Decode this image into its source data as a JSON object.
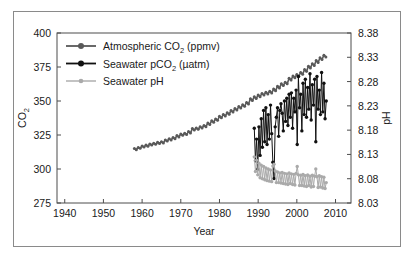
{
  "chart_data": {
    "type": "line",
    "title": "",
    "xlabel": "Year",
    "ylabel": "CO2",
    "ylabel_sub": "2",
    "y2label": "pH",
    "xlim": [
      1938,
      2014
    ],
    "ylim": [
      275,
      400
    ],
    "y2lim": [
      8.03,
      8.38
    ],
    "xticks": [
      1940,
      1950,
      1960,
      1970,
      1980,
      1990,
      2000,
      2010
    ],
    "yticks": [
      275,
      300,
      325,
      350,
      375,
      400
    ],
    "y2ticks": [
      "8.03",
      "8.08",
      "8.13",
      "8.18",
      "8.23",
      "8.28",
      "8.33",
      "8.38"
    ],
    "grid": false,
    "legend_position": "upper-left",
    "colors": {
      "atmospheric_co2": "#595959",
      "seawater_pco2": "#111111",
      "seawater_ph": "#aaaaaa",
      "frame": "#4d4d4d",
      "text": "#1a1a1a",
      "outer_border": "#8a8a8a",
      "background": "#ffffff"
    },
    "series": [
      {
        "name": "Atmospheric CO2 (ppmv)",
        "label_main": "Atmospheric CO",
        "label_sub": "2",
        "label_unit": " (ppmv)",
        "axis": "left",
        "color": "#595959",
        "x": [
          1958.0,
          1958.5,
          1959.0,
          1959.5,
          1960.0,
          1960.5,
          1961.0,
          1961.5,
          1962.0,
          1962.5,
          1963.0,
          1963.5,
          1964.0,
          1964.5,
          1965.0,
          1965.5,
          1966.0,
          1966.5,
          1967.0,
          1967.5,
          1968.0,
          1968.5,
          1969.0,
          1969.5,
          1970.0,
          1970.5,
          1971.0,
          1971.5,
          1972.0,
          1972.5,
          1973.0,
          1973.5,
          1974.0,
          1974.5,
          1975.0,
          1975.5,
          1976.0,
          1976.5,
          1977.0,
          1977.5,
          1978.0,
          1978.5,
          1979.0,
          1979.5,
          1980.0,
          1980.5,
          1981.0,
          1981.5,
          1982.0,
          1982.5,
          1983.0,
          1983.5,
          1984.0,
          1984.5,
          1985.0,
          1985.5,
          1986.0,
          1986.5,
          1987.0,
          1987.5,
          1988.0,
          1988.5,
          1989.0,
          1989.5,
          1990.0,
          1990.5,
          1991.0,
          1991.5,
          1992.0,
          1992.5,
          1993.0,
          1993.5,
          1994.0,
          1994.5,
          1995.0,
          1995.5,
          1996.0,
          1996.5,
          1997.0,
          1997.5,
          1998.0,
          1998.5,
          1999.0,
          1999.5,
          2000.0,
          2000.5,
          2001.0,
          2001.5,
          2002.0,
          2002.5,
          2003.0,
          2003.5,
          2004.0,
          2004.5,
          2005.0,
          2005.5,
          2006.0,
          2006.5,
          2007.0,
          2007.5
        ],
        "y": [
          315.0,
          314.2,
          315.9,
          315.2,
          316.9,
          316.1,
          317.6,
          316.8,
          318.4,
          317.6,
          319.0,
          318.2,
          319.6,
          318.8,
          320.0,
          319.2,
          321.4,
          320.5,
          322.2,
          321.3,
          323.1,
          322.2,
          324.6,
          323.6,
          325.7,
          324.8,
          326.3,
          325.3,
          327.5,
          326.4,
          329.7,
          328.6,
          330.2,
          329.2,
          331.1,
          330.1,
          332.0,
          331.1,
          333.8,
          332.8,
          335.4,
          334.4,
          336.8,
          335.8,
          338.7,
          337.6,
          340.1,
          339.0,
          341.4,
          340.3,
          343.0,
          341.9,
          344.4,
          343.3,
          345.9,
          344.8,
          347.2,
          346.1,
          348.9,
          347.8,
          351.6,
          350.4,
          353.1,
          351.9,
          354.4,
          353.2,
          355.6,
          354.4,
          356.4,
          355.2,
          357.1,
          355.9,
          358.8,
          357.6,
          360.8,
          359.6,
          362.6,
          361.4,
          363.8,
          362.6,
          366.7,
          365.4,
          368.4,
          367.1,
          369.5,
          368.2,
          371.0,
          369.7,
          373.1,
          371.8,
          375.6,
          374.3,
          377.4,
          376.1,
          379.7,
          378.4,
          381.8,
          380.5,
          383.7,
          382.4
        ]
      },
      {
        "name": "Seawater pCO2 (uatm)",
        "label_main": "Seawater pCO",
        "label_sub": "2",
        "label_unit": " (µatm)",
        "axis": "left",
        "color": "#111111",
        "x": [
          1989.0,
          1989.3,
          1989.6,
          1989.9,
          1990.2,
          1990.5,
          1990.8,
          1991.1,
          1991.4,
          1991.7,
          1992.0,
          1992.3,
          1992.6,
          1992.9,
          1993.2,
          1993.5,
          1993.8,
          1994.1,
          1994.4,
          1994.7,
          1995.0,
          1995.3,
          1995.6,
          1995.9,
          1996.2,
          1996.5,
          1996.8,
          1997.1,
          1997.4,
          1997.7,
          1998.0,
          1998.3,
          1998.6,
          1998.9,
          1999.2,
          1999.5,
          1999.8,
          2000.1,
          2000.4,
          2000.7,
          2001.0,
          2001.3,
          2001.6,
          2001.9,
          2002.2,
          2002.5,
          2002.8,
          2003.1,
          2003.4,
          2003.7,
          2004.0,
          2004.3,
          2004.6,
          2004.9,
          2005.2,
          2005.5,
          2005.8,
          2006.1,
          2006.4,
          2006.7,
          2007.0,
          2007.3,
          2007.6
        ],
        "y": [
          330.0,
          306.0,
          322.0,
          300.0,
          331.0,
          310.0,
          337.0,
          316.0,
          343.0,
          320.0,
          345.0,
          318.0,
          340.0,
          322.0,
          347.0,
          326.0,
          305.0,
          293.0,
          331.0,
          338.0,
          345.0,
          324.0,
          343.0,
          348.0,
          341.0,
          328.0,
          350.0,
          335.0,
          352.0,
          332.0,
          355.0,
          338.0,
          356.0,
          330.0,
          352.0,
          342.0,
          358.0,
          318.0,
          368.0,
          345.0,
          355.0,
          328.0,
          363.0,
          340.0,
          366.0,
          338.0,
          360.0,
          344.0,
          370.0,
          336.0,
          362.0,
          347.0,
          366.0,
          320.0,
          368.0,
          344.0,
          358.0,
          340.0,
          371.0,
          342.0,
          363.0,
          337.0,
          350.0
        ]
      },
      {
        "name": "Seawater pH",
        "label_main": "Seawater pH",
        "label_sub": "",
        "label_unit": "",
        "axis": "right",
        "color": "#aaaaaa",
        "x": [
          1989.0,
          1989.3,
          1989.6,
          1989.9,
          1990.2,
          1990.5,
          1990.8,
          1991.1,
          1991.4,
          1991.7,
          1992.0,
          1992.3,
          1992.6,
          1992.9,
          1993.2,
          1993.5,
          1993.8,
          1994.1,
          1994.4,
          1994.7,
          1995.0,
          1995.3,
          1995.6,
          1995.9,
          1996.2,
          1996.5,
          1996.8,
          1997.1,
          1997.4,
          1997.7,
          1998.0,
          1998.3,
          1998.6,
          1998.9,
          1999.2,
          1999.5,
          1999.8,
          2000.1,
          2000.4,
          2000.7,
          2001.0,
          2001.3,
          2001.6,
          2001.9,
          2002.2,
          2002.5,
          2002.8,
          2003.1,
          2003.4,
          2003.7,
          2004.0,
          2004.3,
          2004.6,
          2004.9,
          2005.2,
          2005.5,
          2005.8,
          2006.1,
          2006.4,
          2006.7,
          2007.0,
          2007.3,
          2007.6
        ],
        "y": [
          8.125,
          8.095,
          8.118,
          8.088,
          8.112,
          8.082,
          8.108,
          8.08,
          8.105,
          8.078,
          8.102,
          8.076,
          8.1,
          8.075,
          8.098,
          8.074,
          8.106,
          8.11,
          8.096,
          8.072,
          8.094,
          8.072,
          8.092,
          8.071,
          8.093,
          8.07,
          8.091,
          8.069,
          8.09,
          8.068,
          8.092,
          8.07,
          8.09,
          8.068,
          8.089,
          8.067,
          8.091,
          8.105,
          8.088,
          8.066,
          8.087,
          8.066,
          8.089,
          8.065,
          8.086,
          8.064,
          8.088,
          8.066,
          8.085,
          8.063,
          8.087,
          8.064,
          8.085,
          8.1,
          8.084,
          8.062,
          8.086,
          8.063,
          8.084,
          8.061,
          8.083,
          8.06,
          8.072
        ]
      }
    ]
  }
}
